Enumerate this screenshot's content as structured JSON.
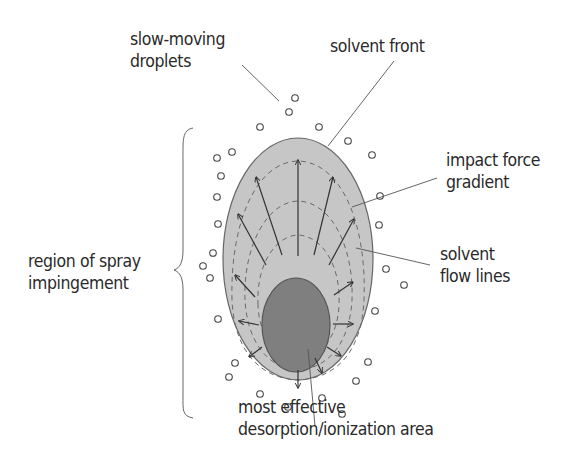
{
  "labels": {
    "slow_moving_droplets": {
      "line1": "slow-moving",
      "line2": "droplets"
    },
    "solvent_front": {
      "line1": "solvent front"
    },
    "impact_force_gradient": {
      "line1": "impact force",
      "line2": "gradient"
    },
    "solvent_flow_lines": {
      "line1": "solvent",
      "line2": "flow lines"
    },
    "region_of_spray": {
      "line1": "region of spray",
      "line2": "impingement"
    },
    "most_effective": {
      "line1": "most effective",
      "line2": "desorption/ionization area"
    }
  },
  "colors": {
    "outer_fill": "#c6c6c6",
    "inner_fill": "#7f7f7f",
    "stroke": "#555555",
    "dash": "#6a6a6a",
    "arrow": "#333333",
    "text": "#2a2a2a"
  }
}
